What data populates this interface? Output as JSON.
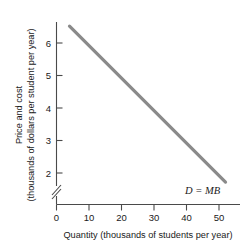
{
  "chart_data": {
    "type": "line",
    "title": "",
    "xlabel": "Quantity (thousands of students per year)",
    "ylabel_line1": "Price and cost",
    "ylabel_line2": "(thousands of dollars per student per year)",
    "xlim": [
      0,
      58
    ],
    "ylim": [
      1.3,
      6.9
    ],
    "y_axis_broken": true,
    "y_break_below": 2,
    "grid": false,
    "legend_position": "inline-right",
    "xticks": [
      0,
      10,
      20,
      30,
      40,
      50
    ],
    "xtick_labels": [
      "0",
      "10",
      "20",
      "30",
      "40",
      "50"
    ],
    "yticks": [
      2,
      3,
      4,
      5,
      6
    ],
    "ytick_labels": [
      "2",
      "3",
      "4",
      "5",
      "6"
    ],
    "series": [
      {
        "name": "D = MB",
        "label": "D = MB",
        "color": "#8a8a8a",
        "linewidth": 3.2,
        "x": [
          4,
          52
        ],
        "y": [
          6.52,
          1.72
        ]
      }
    ],
    "annotations": [
      {
        "text": "D = MB",
        "x": 44,
        "y": 1.58,
        "style": "italic"
      }
    ]
  },
  "axes": {
    "y_label_line1": "Price and cost",
    "y_label_line2": "(thousands of dollars per student per year)",
    "x_label": "Quantity (thousands of students per year)",
    "x_tick_0": "0",
    "x_tick_10": "10",
    "x_tick_20": "20",
    "x_tick_30": "30",
    "x_tick_40": "40",
    "x_tick_50": "50",
    "y_tick_2": "2",
    "y_tick_3": "3",
    "y_tick_4": "4",
    "y_tick_5": "5",
    "y_tick_6": "6"
  },
  "curve": {
    "label": "D = MB"
  },
  "colors": {
    "curve": "#8a8a8a",
    "axis": "#4a4a4a",
    "text": "#1a1a1a",
    "background": "#ffffff"
  }
}
